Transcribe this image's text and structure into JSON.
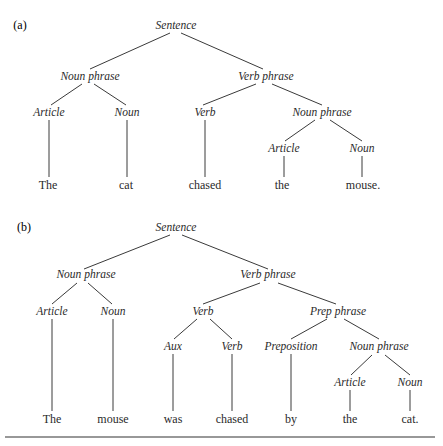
{
  "figure": {
    "panels": [
      {
        "label": "(a)",
        "label_pos": [
          20,
          29
        ],
        "nodes": [
          {
            "id": "S",
            "text": "Sentence",
            "x": 176,
            "y": 29,
            "type": "node"
          },
          {
            "id": "NP",
            "text": "Noun phrase",
            "x": 90,
            "y": 80,
            "type": "node"
          },
          {
            "id": "VP",
            "text": "Verb phrase",
            "x": 266,
            "y": 80,
            "type": "node"
          },
          {
            "id": "Art1",
            "text": "Article",
            "x": 49,
            "y": 116,
            "type": "node"
          },
          {
            "id": "N1",
            "text": "Noun",
            "x": 127,
            "y": 116,
            "type": "node"
          },
          {
            "id": "V1",
            "text": "Verb",
            "x": 205,
            "y": 116,
            "type": "node"
          },
          {
            "id": "NP2",
            "text": "Noun phrase",
            "x": 322,
            "y": 116,
            "type": "node"
          },
          {
            "id": "Art2",
            "text": "Article",
            "x": 284,
            "y": 152,
            "type": "node"
          },
          {
            "id": "N2",
            "text": "Noun",
            "x": 362,
            "y": 152,
            "type": "node"
          },
          {
            "id": "w1",
            "text": "The",
            "x": 48,
            "y": 189,
            "type": "leaf"
          },
          {
            "id": "w2",
            "text": "cat",
            "x": 126,
            "y": 189,
            "type": "leaf"
          },
          {
            "id": "w3",
            "text": "chased",
            "x": 205,
            "y": 189,
            "type": "leaf"
          },
          {
            "id": "w4",
            "text": "the",
            "x": 282,
            "y": 189,
            "type": "leaf"
          },
          {
            "id": "w5",
            "text": "mouse.",
            "x": 363,
            "y": 189,
            "type": "leaf"
          }
        ],
        "edges": [
          [
            170,
            33,
            90,
            69
          ],
          [
            181,
            33,
            263,
            69
          ],
          [
            82,
            84,
            51,
            105
          ],
          [
            94,
            84,
            126,
            105
          ],
          [
            256,
            84,
            203,
            105
          ],
          [
            272,
            84,
            322,
            105
          ],
          [
            315,
            120,
            285,
            141
          ],
          [
            330,
            120,
            362,
            141
          ],
          [
            49,
            120,
            49,
            177
          ],
          [
            127,
            120,
            127,
            177
          ],
          [
            205,
            120,
            205,
            177
          ],
          [
            284,
            156,
            284,
            177
          ],
          [
            362,
            156,
            362,
            177
          ]
        ]
      },
      {
        "label": "(b)",
        "label_pos": [
          24,
          231
        ],
        "nodes": [
          {
            "id": "S",
            "text": "Sentence",
            "x": 176,
            "y": 231,
            "type": "node"
          },
          {
            "id": "NP",
            "text": "Noun phrase",
            "x": 86,
            "y": 278,
            "type": "node"
          },
          {
            "id": "VP",
            "text": "Verb phrase",
            "x": 268,
            "y": 278,
            "type": "node"
          },
          {
            "id": "Art1",
            "text": "Article",
            "x": 52,
            "y": 315,
            "type": "node"
          },
          {
            "id": "N1",
            "text": "Noun",
            "x": 113,
            "y": 315,
            "type": "node"
          },
          {
            "id": "V",
            "text": "Verb",
            "x": 203,
            "y": 315,
            "type": "node"
          },
          {
            "id": "PP",
            "text": "Prep phrase",
            "x": 338,
            "y": 315,
            "type": "node"
          },
          {
            "id": "Aux",
            "text": "Aux",
            "x": 173,
            "y": 350,
            "type": "node"
          },
          {
            "id": "V2",
            "text": "Verb",
            "x": 232,
            "y": 350,
            "type": "node"
          },
          {
            "id": "P",
            "text": "Preposition",
            "x": 291,
            "y": 350,
            "type": "node"
          },
          {
            "id": "NP2",
            "text": "Noun phrase",
            "x": 379,
            "y": 350,
            "type": "node"
          },
          {
            "id": "Art2",
            "text": "Article",
            "x": 350,
            "y": 386,
            "type": "node"
          },
          {
            "id": "N2",
            "text": "Noun",
            "x": 410,
            "y": 386,
            "type": "node"
          },
          {
            "id": "w1",
            "text": "The",
            "x": 52,
            "y": 423,
            "type": "leaf"
          },
          {
            "id": "w2",
            "text": "mouse",
            "x": 113,
            "y": 423,
            "type": "leaf"
          },
          {
            "id": "w3",
            "text": "was",
            "x": 173,
            "y": 423,
            "type": "leaf"
          },
          {
            "id": "w4",
            "text": "chased",
            "x": 232,
            "y": 423,
            "type": "leaf"
          },
          {
            "id": "w5",
            "text": "by",
            "x": 291,
            "y": 423,
            "type": "leaf"
          },
          {
            "id": "w6",
            "text": "the",
            "x": 350,
            "y": 423,
            "type": "leaf"
          },
          {
            "id": "w7",
            "text": "cat.",
            "x": 410,
            "y": 423,
            "type": "leaf"
          }
        ],
        "edges": [
          [
            170,
            235,
            84,
            269
          ],
          [
            182,
            235,
            268,
            269
          ],
          [
            77,
            283,
            52,
            304
          ],
          [
            88,
            283,
            112,
            304
          ],
          [
            260,
            283,
            203,
            304
          ],
          [
            278,
            283,
            336,
            304
          ],
          [
            197,
            319,
            174,
            339
          ],
          [
            210,
            319,
            232,
            339
          ],
          [
            327,
            319,
            291,
            339
          ],
          [
            344,
            319,
            379,
            339
          ],
          [
            372,
            355,
            351,
            375
          ],
          [
            385,
            355,
            410,
            375
          ],
          [
            52,
            319,
            52,
            411
          ],
          [
            113,
            319,
            113,
            411
          ],
          [
            173,
            354,
            173,
            411
          ],
          [
            232,
            354,
            232,
            411
          ],
          [
            291,
            354,
            291,
            411
          ],
          [
            350,
            390,
            350,
            411
          ],
          [
            410,
            390,
            410,
            411
          ]
        ]
      }
    ],
    "bottom_rule": [
      5,
      437,
      435,
      437
    ]
  }
}
